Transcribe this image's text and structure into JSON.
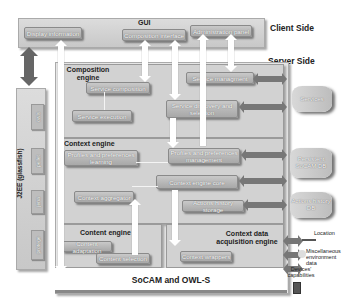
{
  "labels": {
    "client_side": "Client Side",
    "server_side": "Server Side",
    "gui": "GUI",
    "composition_engine": "Composition engine",
    "context_engine": "Context engine",
    "content_engine": "Content engine",
    "context_data_acquisition_engine": "Context data acquisition engine",
    "socam_owls": "SoCAM and OWL-S",
    "j2ee": "J2EE (glassfish)"
  },
  "gui": {
    "display_information": "Display information",
    "composition_interface": "Composition interface",
    "administration_panel": "Administration panel"
  },
  "composition": {
    "service_composition": "Service composition",
    "service_execution": "Service execution",
    "service_management": "Service managment",
    "service_discovery": "Service discovery and selection"
  },
  "context": {
    "profiles_learning": "Profiles and preferences learning",
    "profiles_management": "Profiles and preferences management",
    "context_engine_core": "Context engine core",
    "context_aggregator": "Context aggregator",
    "actions_history_storage": "Actions history storage"
  },
  "content": {
    "content_adaptation": "Content adaptation",
    "content_selection": "Content selection"
  },
  "acquisition": {
    "context_wrappers": "Context wrappers"
  },
  "databases": {
    "services": "Services",
    "persistent_socam_db": "Persistent SoCAM DB",
    "actions_history_db": "Actions history DB"
  },
  "j2ee_modules": [
    "owls",
    "pellet",
    "jena",
    "protege"
  ],
  "sources": {
    "location": "Location",
    "misc_env": "Miscellaneous environment data",
    "device_capabilities": "Devices' capabilities"
  },
  "left_arrow_label": "SOAP"
}
